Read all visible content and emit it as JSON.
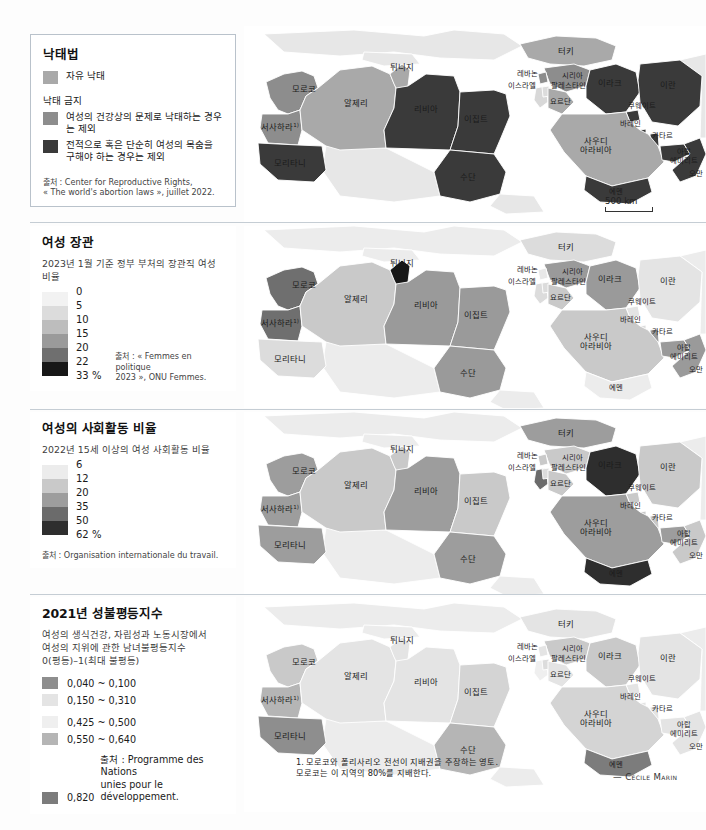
{
  "page": {
    "credit": "— Cécile Marin",
    "scale_label": "500 km",
    "footnote": "1. 모로코와 폴리사리오 전선이 지배권을 주장하는 영토.\n모로코는 이 지역의 80%를 지배한다."
  },
  "panels": [
    {
      "id": "abortion-law",
      "title": "낙태법",
      "subtitle": "",
      "legend_type": "categorical",
      "items": [
        {
          "label": "자유 낙태",
          "color": "#a9a9a9"
        }
      ],
      "group_label": "낙태 금지",
      "group_items": [
        {
          "label": "여성의 건강상의 문제로 낙태하는 경우는 제외",
          "color": "#8d8d8d"
        },
        {
          "label": "전적으로 혹은 단순히 여성의 목숨을\n구해야 하는 경우는 제외",
          "color": "#3a3a3a"
        }
      ],
      "source": "출처 : Center for Reproductive Rights,\n« The world's abortion laws », juillet 2022."
    },
    {
      "id": "women-ministers",
      "title": "여성 장관",
      "subtitle": "2023년 1월 기준 정부 부처의 장관직 여성 비율",
      "legend_type": "ramp",
      "ramp_values": [
        "0",
        "5",
        "10",
        "15",
        "20",
        "22",
        "33 %"
      ],
      "ramp_colors": [
        "#f2f2f2",
        "#dcdcdc",
        "#bdbdbd",
        "#9a9a9a",
        "#6f6f6f",
        "#171717"
      ],
      "source": "출처 : « Femmes en politique\n2023 », ONU Femmes."
    },
    {
      "id": "women-labour",
      "title": "여성의 사회활동 비율",
      "subtitle": "2022년 15세 이상의 여성 사회활동 비율",
      "legend_type": "ramp",
      "ramp_values": [
        "6",
        "12",
        "20",
        "35",
        "50",
        "62 %"
      ],
      "ramp_colors": [
        "#ececec",
        "#c9c9c9",
        "#9d9d9d",
        "#6b6b6b",
        "#2e2e2e"
      ],
      "source": "출처 : Organisation internationale du travail."
    },
    {
      "id": "gender-inequality-index",
      "title": "2021년 성불평등지수",
      "subtitle": "여성의 생식건강, 자립성과 노동시장에서\n여성의 지위에 관한 남녀불평등지수\n0(평등)–1(최대 불평등)",
      "legend_type": "classes",
      "classes": [
        {
          "label": "0,040 ~ 0,100",
          "color": "#8e8e8e"
        },
        {
          "label": "0,150 ~ 0,310",
          "color": "#e4e4e4"
        },
        {
          "label": "0,425 ~ 0,500",
          "color": "#efefef"
        },
        {
          "label": "0,550 ~ 0,640",
          "color": "#b5b5b5"
        },
        {
          "label": "0,820",
          "color": "#7c7c7c"
        }
      ],
      "source": "출처 : Programme des Nations\nunies pour le développement."
    }
  ],
  "map_labels": {
    "morocco": "모로코",
    "western_sahara": "서사하라",
    "western_sahara_note": "1)",
    "algeria": "알제리",
    "tunisia": "튀니지",
    "libya": "리비아",
    "egypt": "이집트",
    "mauritania": "모리타니",
    "sudan": "수단",
    "turkey": "터키",
    "syria": "시리아",
    "lebanon": "레바논",
    "israel": "이스라엘",
    "palestine": "팔레스타인",
    "jordan": "요르단",
    "iraq": "이라크",
    "iran": "이란",
    "kuwait": "쿠웨이트",
    "bahrain": "바레인",
    "qatar": "카타르",
    "saudi_arabia": "사우디\n아라비아",
    "uae": "아랍\n에미리트",
    "oman": "오만",
    "yemen": "예멘"
  },
  "map_fills": {
    "panel1": {
      "morocco": "#8d8d8d",
      "western_sahara": "#8d8d8d",
      "algeria": "#a9a9a9",
      "tunisia": "#a9a9a9",
      "libya": "#3a3a3a",
      "egypt": "#3a3a3a",
      "mauritania": "#3a3a3a",
      "sudan": "#3a3a3a",
      "turkey": "#a9a9a9",
      "syria": "#8d8d8d",
      "lebanon": "#8d8d8d",
      "israel": "#d8d8d8",
      "jordan": "#a9a9a9",
      "iraq": "#3a3a3a",
      "iran": "#3a3a3a",
      "kuwait": "#3a3a3a",
      "bahrain": "#3a3a3a",
      "qatar": "#3a3a3a",
      "saudi_arabia": "#a9a9a9",
      "uae": "#3a3a3a",
      "oman": "#3a3a3a",
      "yemen": "#3a3a3a",
      "other": "#e7e7e7"
    },
    "panel2": {
      "morocco": "#6f6f6f",
      "western_sahara": "#6f6f6f",
      "algeria": "#c9c9c9",
      "tunisia": "#171717",
      "libya": "#9a9a9a",
      "egypt": "#9a9a9a",
      "mauritania": "#dcdcdc",
      "sudan": "#9a9a9a",
      "turkey": "#dcdcdc",
      "syria": "#9a9a9a",
      "lebanon": "#e8e8e8",
      "israel": "#dcdcdc",
      "jordan": "#c9c9c9",
      "iraq": "#9a9a9a",
      "iran": "#e4e4e4",
      "kuwait": "#e4e4e4",
      "bahrain": "#dcdcdc",
      "qatar": "#9a9a9a",
      "saudi_arabia": "#c9c9c9",
      "uae": "#9a9a9a",
      "oman": "#9a9a9a",
      "yemen": "#ececec",
      "other": "#ececec"
    },
    "panel3": {
      "morocco": "#9d9d9d",
      "western_sahara": "#9d9d9d",
      "algeria": "#c9c9c9",
      "tunisia": "#c9c9c9",
      "libya": "#9d9d9d",
      "egypt": "#c9c9c9",
      "mauritania": "#9d9d9d",
      "sudan": "#9d9d9d",
      "turkey": "#9d9d9d",
      "syria": "#c9c9c9",
      "lebanon": "#c9c9c9",
      "israel": "#6b6b6b",
      "jordan": "#c9c9c9",
      "iraq": "#2e2e2e",
      "iran": "#c9c9c9",
      "kuwait": "#c9c9c9",
      "bahrain": "#c9c9c9",
      "qatar": "#c9c9c9",
      "saudi_arabia": "#9d9d9d",
      "uae": "#9d9d9d",
      "oman": "#c9c9c9",
      "yemen": "#2e2e2e",
      "other": "#ececec"
    },
    "panel4": {
      "morocco": "#c9c9c9",
      "western_sahara": "#b5b5b5",
      "algeria": "#e4e4e4",
      "tunisia": "#e4e4e4",
      "libya": "#e4e4e4",
      "egypt": "#d4d4d4",
      "mauritania": "#8e8e8e",
      "sudan": "#b5b5b5",
      "turkey": "#e4e4e4",
      "syria": "#c9c9c9",
      "lebanon": "#e4e4e4",
      "israel": "#efefef",
      "jordan": "#e4e4e4",
      "iraq": "#c9c9c9",
      "iran": "#e4e4e4",
      "kuwait": "#e4e4e4",
      "bahrain": "#e4e4e4",
      "qatar": "#e4e4e4",
      "saudi_arabia": "#d4d4d4",
      "uae": "#e4e4e4",
      "oman": "#e4e4e4",
      "yemen": "#7c7c7c",
      "other": "#ececec"
    }
  }
}
